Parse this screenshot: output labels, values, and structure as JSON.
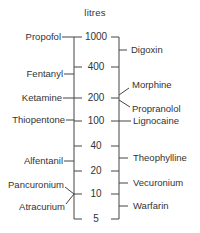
{
  "diagram": {
    "title": "litres",
    "scale": {
      "ticks": [
        {
          "value": "1000",
          "y": 37
        },
        {
          "value": "400",
          "y": 67
        },
        {
          "value": "200",
          "y": 98
        },
        {
          "value": "100",
          "y": 121
        },
        {
          "value": "40",
          "y": 146
        },
        {
          "value": "20",
          "y": 171
        },
        {
          "value": "10",
          "y": 194
        },
        {
          "value": "5",
          "y": 219
        }
      ]
    },
    "left_drugs": [
      {
        "name": "Propofol",
        "y": 37
      },
      {
        "name": "Fentanyl",
        "y": 74
      },
      {
        "name": "Ketamine",
        "y": 98
      },
      {
        "name": "Thiopentone",
        "y": 120
      },
      {
        "name": "Alfentanil",
        "y": 161
      },
      {
        "name": "Pancuronium",
        "y": 185
      },
      {
        "name": "Atracurium",
        "y": 207
      }
    ],
    "right_drugs": [
      {
        "name": "Digoxin",
        "y": 50
      },
      {
        "name": "Morphine",
        "y": 85
      },
      {
        "name": "Propranolol",
        "y": 109
      },
      {
        "name": "Lignocaine",
        "y": 121
      },
      {
        "name": "Theophylline",
        "y": 158
      },
      {
        "name": "Vecuronium",
        "y": 183
      },
      {
        "name": "Warfarin",
        "y": 206
      }
    ]
  }
}
